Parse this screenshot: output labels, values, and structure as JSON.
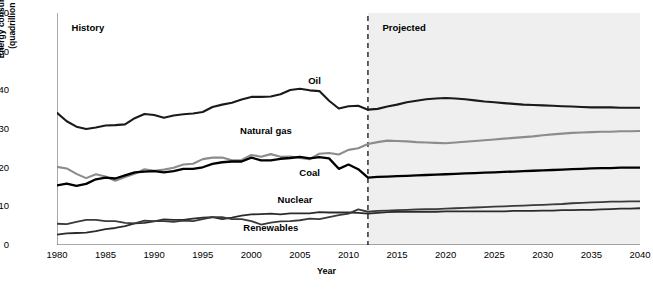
{
  "chart_data": {
    "type": "line",
    "title": "",
    "xlabel": "Year",
    "ylabel": "Energy consumption\n(quadrillion Btu)",
    "ylabel_line1": "Energy consumption",
    "ylabel_line2": "(quadrillion Btu)",
    "xlim": [
      1980,
      2040
    ],
    "ylim": [
      0,
      60
    ],
    "yticks": [
      0,
      10,
      20,
      30,
      40,
      50,
      60
    ],
    "xticks": [
      1980,
      1985,
      1990,
      1995,
      2000,
      2005,
      2010,
      2015,
      2020,
      2025,
      2030,
      2035,
      2040
    ],
    "grid": false,
    "legend_position": "inline-annotations",
    "annotations": [
      {
        "name": "history",
        "text": "History",
        "x": 1981.5,
        "y": 56
      },
      {
        "name": "projected",
        "text": "Projected",
        "x": 2013.5,
        "y": 56
      }
    ],
    "divider": {
      "x": 2012,
      "style": "dashed",
      "label_left": "History",
      "label_right": "Projected"
    },
    "shaded_region": {
      "from": 2012,
      "to": 2040,
      "color": "#efefef"
    },
    "series": [
      {
        "name": "Oil",
        "color": "#1a1a1a",
        "width": 2.1,
        "label_x": 2006.5,
        "label_y": 42.5,
        "x": [
          1980,
          1981,
          1982,
          1983,
          1984,
          1985,
          1986,
          1987,
          1988,
          1989,
          1990,
          1991,
          1992,
          1993,
          1994,
          1995,
          1996,
          1997,
          1998,
          1999,
          2000,
          2001,
          2002,
          2003,
          2004,
          2005,
          2006,
          2007,
          2008,
          2009,
          2010,
          2011,
          2012,
          2013,
          2014,
          2015,
          2016,
          2017,
          2018,
          2019,
          2020,
          2021,
          2022,
          2023,
          2024,
          2025,
          2026,
          2027,
          2028,
          2029,
          2030,
          2031,
          2032,
          2033,
          2034,
          2035,
          2036,
          2037,
          2038,
          2039,
          2040
        ],
        "y": [
          34.2,
          32.0,
          30.6,
          30.0,
          30.4,
          30.9,
          31.0,
          31.2,
          32.8,
          33.9,
          33.6,
          32.9,
          33.5,
          33.8,
          34.0,
          34.4,
          35.7,
          36.3,
          36.8,
          37.6,
          38.3,
          38.3,
          38.4,
          39.0,
          40.1,
          40.4,
          40.0,
          39.8,
          37.3,
          35.3,
          35.9,
          36.0,
          35.0,
          35.2,
          35.8,
          36.3,
          36.9,
          37.3,
          37.7,
          37.9,
          38.0,
          37.9,
          37.7,
          37.4,
          37.1,
          36.9,
          36.7,
          36.5,
          36.3,
          36.2,
          36.1,
          36.0,
          35.9,
          35.8,
          35.7,
          35.6,
          35.6,
          35.6,
          35.5,
          35.5,
          35.5
        ]
      },
      {
        "name": "Natural gas",
        "color": "#8c8c8c",
        "width": 2.1,
        "label_x": 2001.5,
        "label_y": 29.5,
        "x": [
          1980,
          1981,
          1982,
          1983,
          1984,
          1985,
          1986,
          1987,
          1988,
          1989,
          1990,
          1991,
          1992,
          1993,
          1994,
          1995,
          1996,
          1997,
          1998,
          1999,
          2000,
          2001,
          2002,
          2003,
          2004,
          2005,
          2006,
          2007,
          2008,
          2009,
          2010,
          2011,
          2012,
          2013,
          2014,
          2015,
          2016,
          2017,
          2018,
          2019,
          2020,
          2021,
          2022,
          2023,
          2024,
          2025,
          2026,
          2027,
          2028,
          2029,
          2030,
          2031,
          2032,
          2033,
          2034,
          2035,
          2036,
          2037,
          2038,
          2039,
          2040
        ],
        "y": [
          20.2,
          19.8,
          18.4,
          17.3,
          18.3,
          17.7,
          16.6,
          17.6,
          18.4,
          19.6,
          19.2,
          19.5,
          20.0,
          20.8,
          21.0,
          22.2,
          22.6,
          22.6,
          21.9,
          22.0,
          23.3,
          22.8,
          23.5,
          22.8,
          22.9,
          22.5,
          22.2,
          23.6,
          23.8,
          23.4,
          24.6,
          25.0,
          26.1,
          26.6,
          27.0,
          26.9,
          26.8,
          26.6,
          26.5,
          26.4,
          26.3,
          26.5,
          26.7,
          26.9,
          27.1,
          27.3,
          27.5,
          27.7,
          27.9,
          28.1,
          28.4,
          28.6,
          28.8,
          29.0,
          29.1,
          29.2,
          29.3,
          29.3,
          29.4,
          29.4,
          29.5
        ]
      },
      {
        "name": "Coal",
        "color": "#000000",
        "width": 2.3,
        "label_x": 2006.0,
        "label_y": 18.5,
        "x": [
          1980,
          1981,
          1982,
          1983,
          1984,
          1985,
          1986,
          1987,
          1988,
          1989,
          1990,
          1991,
          1992,
          1993,
          1994,
          1995,
          1996,
          1997,
          1998,
          1999,
          2000,
          2001,
          2002,
          2003,
          2004,
          2005,
          2006,
          2007,
          2008,
          2009,
          2010,
          2011,
          2012,
          2013,
          2014,
          2015,
          2016,
          2017,
          2018,
          2019,
          2020,
          2021,
          2022,
          2023,
          2024,
          2025,
          2026,
          2027,
          2028,
          2029,
          2030,
          2031,
          2032,
          2033,
          2034,
          2035,
          2036,
          2037,
          2038,
          2039,
          2040
        ],
        "y": [
          15.4,
          15.9,
          15.3,
          15.8,
          17.0,
          17.4,
          17.2,
          18.0,
          18.8,
          19.0,
          19.1,
          18.8,
          19.1,
          19.7,
          19.7,
          20.1,
          21.0,
          21.4,
          21.6,
          21.6,
          22.6,
          21.9,
          21.9,
          22.3,
          22.5,
          22.8,
          22.4,
          22.7,
          22.4,
          19.7,
          20.8,
          19.6,
          17.4,
          17.6,
          17.7,
          17.8,
          17.9,
          18.0,
          18.1,
          18.2,
          18.3,
          18.4,
          18.5,
          18.6,
          18.7,
          18.8,
          18.9,
          19.0,
          19.1,
          19.2,
          19.3,
          19.4,
          19.5,
          19.6,
          19.7,
          19.8,
          19.9,
          19.9,
          20.0,
          20.0,
          20.0
        ]
      },
      {
        "name": "Nuclear",
        "color": "#2b2b2b",
        "width": 1.8,
        "label_x": 2004.5,
        "label_y": 11.6,
        "x": [
          1980,
          1981,
          1982,
          1983,
          1984,
          1985,
          1986,
          1987,
          1988,
          1989,
          1990,
          1991,
          1992,
          1993,
          1994,
          1995,
          1996,
          1997,
          1998,
          1999,
          2000,
          2001,
          2002,
          2003,
          2004,
          2005,
          2006,
          2007,
          2008,
          2009,
          2010,
          2011,
          2012,
          2013,
          2014,
          2015,
          2016,
          2017,
          2018,
          2019,
          2020,
          2021,
          2022,
          2023,
          2024,
          2025,
          2026,
          2027,
          2028,
          2029,
          2030,
          2031,
          2032,
          2033,
          2034,
          2035,
          2036,
          2037,
          2038,
          2039,
          2040
        ],
        "y": [
          2.7,
          3.0,
          3.1,
          3.2,
          3.6,
          4.1,
          4.4,
          4.9,
          5.6,
          5.7,
          6.1,
          6.6,
          6.5,
          6.5,
          6.8,
          7.1,
          7.2,
          6.7,
          7.1,
          7.6,
          7.9,
          8.0,
          8.1,
          7.9,
          8.2,
          8.2,
          8.2,
          8.5,
          8.4,
          8.4,
          8.4,
          8.3,
          8.1,
          8.3,
          8.5,
          8.6,
          8.6,
          8.6,
          8.6,
          8.6,
          8.7,
          8.7,
          8.7,
          8.7,
          8.7,
          8.7,
          8.7,
          8.8,
          8.8,
          8.8,
          8.9,
          8.9,
          9.0,
          9.0,
          9.1,
          9.1,
          9.2,
          9.3,
          9.4,
          9.4,
          9.5
        ]
      },
      {
        "name": "Renewables",
        "color": "#3a3a3a",
        "width": 1.8,
        "label_x": 2002.0,
        "label_y": 4.3,
        "x": [
          1980,
          1981,
          1982,
          1983,
          1984,
          1985,
          1986,
          1987,
          1988,
          1989,
          1990,
          1991,
          1992,
          1993,
          1994,
          1995,
          1996,
          1997,
          1998,
          1999,
          2000,
          2001,
          2002,
          2003,
          2004,
          2005,
          2006,
          2007,
          2008,
          2009,
          2010,
          2011,
          2012,
          2013,
          2014,
          2015,
          2016,
          2017,
          2018,
          2019,
          2020,
          2021,
          2022,
          2023,
          2024,
          2025,
          2026,
          2027,
          2028,
          2029,
          2030,
          2031,
          2032,
          2033,
          2034,
          2035,
          2036,
          2037,
          2038,
          2039,
          2040
        ],
        "y": [
          5.5,
          5.4,
          6.0,
          6.5,
          6.5,
          6.2,
          6.2,
          5.7,
          5.6,
          6.3,
          6.2,
          6.2,
          6.0,
          6.3,
          6.2,
          6.7,
          7.2,
          7.2,
          6.7,
          6.7,
          6.2,
          5.3,
          5.8,
          6.1,
          6.2,
          6.4,
          6.8,
          6.7,
          7.2,
          7.7,
          8.1,
          9.2,
          8.6,
          8.8,
          8.9,
          9.0,
          9.1,
          9.2,
          9.3,
          9.3,
          9.4,
          9.5,
          9.6,
          9.7,
          9.8,
          9.9,
          10.0,
          10.1,
          10.2,
          10.3,
          10.4,
          10.5,
          10.6,
          10.8,
          10.9,
          11.0,
          11.1,
          11.2,
          11.2,
          11.3,
          11.3
        ]
      }
    ]
  }
}
